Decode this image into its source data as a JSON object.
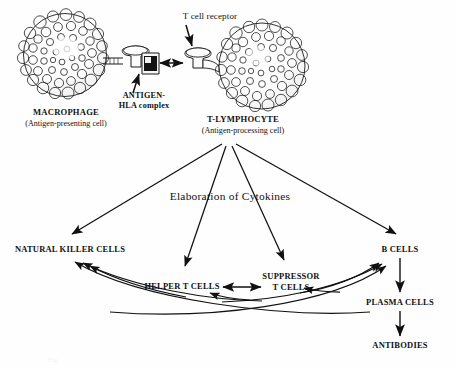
{
  "figure": {
    "kind": "immunology-flow-diagram",
    "title_visible": false,
    "ink_color": "#111111",
    "background_color": "#fefefe"
  },
  "top_section": {
    "macrophage": {
      "name_label": "MACROPHAGE",
      "sub_label": "(Antigen-presenting cell)",
      "icon": "granular-cell-sphere"
    },
    "t_lymphocyte": {
      "name_label": "T-LYMPHOCYTE",
      "sub_label": "(Antigen-processing cell)",
      "icon": "granular-cell-sphere"
    },
    "antigen_hla": {
      "line1": "ANTIGEN-",
      "line2": "HLA complex",
      "icon": "mhc-mushroom-with-antigen-box"
    },
    "t_cell_receptor": {
      "label": "T cell receptor",
      "icon": "receptor-mushroom"
    },
    "binding_arrow": {
      "icon": "double-headed-arrow",
      "direction": "bidirectional"
    }
  },
  "middle_section": {
    "cytokines_label": "Elaboration of Cytokines",
    "fan": {
      "icon": "four-way-arrow-fan",
      "source": "t-lymphocyte",
      "targets": [
        "NATURAL KILLER CELLS",
        "HELPER T CELLS",
        "SUPPRESSOR T CELLS",
        "B CELLS"
      ]
    }
  },
  "effector_nodes": [
    {
      "id": "natural-killer-cells",
      "label": "NATURAL KILLER CELLS",
      "label_lines": [
        "NATURAL KILLER CELLS"
      ]
    },
    {
      "id": "helper-t-cells",
      "label": "HELPER T CELLS",
      "label_lines": [
        "HELPER T CELLS"
      ]
    },
    {
      "id": "suppressor-t-cells",
      "label": "SUPPRESSOR T CELLS",
      "label_lines": [
        "SUPPRESSOR",
        "T CELLS"
      ]
    },
    {
      "id": "b-cells",
      "label": "B CELLS",
      "label_lines": [
        "B CELLS"
      ]
    },
    {
      "id": "plasma-cells",
      "label": "PLASMA CELLS",
      "label_lines": [
        "PLASMA CELLS"
      ]
    },
    {
      "id": "antibodies",
      "label": "ANTIBODIES",
      "label_lines": [
        "ANTIBODIES"
      ]
    }
  ],
  "connections": {
    "helper_suppressor": {
      "icon": "double-headed-arrow",
      "direction": "bidirectional"
    },
    "to_natural_killer": {
      "icon": "curved-arrow",
      "count": 3,
      "direction": "right-to-left"
    },
    "to_b_cells": {
      "icon": "curved-arrow",
      "count": 3,
      "direction": "left-to-right"
    },
    "b_to_plasma": {
      "icon": "straight-arrow",
      "direction": "down"
    },
    "plasma_to_antibodies": {
      "icon": "straight-arrow",
      "direction": "down"
    }
  },
  "faint_caption": "Fig."
}
